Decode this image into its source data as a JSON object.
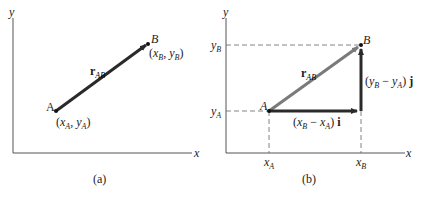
{
  "panels": [
    {
      "caption": "(a)",
      "axis_x_label": "x",
      "axis_y_label": "y",
      "vector_label": "r",
      "vector_label_sub": "AB",
      "point_a_label": "A",
      "point_b_label": "B",
      "point_a_coords": {
        "open": "(",
        "x": "x",
        "x_sub": "A",
        "sep": ", ",
        "y": "y",
        "y_sub": "A",
        "close": ")"
      },
      "point_b_coords": {
        "open": "(",
        "x": "x",
        "x_sub": "B",
        "sep": ", ",
        "y": "y",
        "y_sub": "B",
        "close": ")"
      }
    },
    {
      "caption": "(b)",
      "axis_x_label": "x",
      "axis_y_label": "y",
      "vector_label": "r",
      "vector_label_sub": "AB",
      "point_a_label": "A",
      "point_b_label": "B",
      "tick_xa": "x",
      "tick_xa_sub": "A",
      "tick_xb": "x",
      "tick_xb_sub": "B",
      "tick_ya": "y",
      "tick_ya_sub": "A",
      "tick_yb": "y",
      "tick_yb_sub": "B",
      "horizontal_component": {
        "open": "(",
        "a": "x",
        "a_sub": "B",
        "minus": " − ",
        "b": "x",
        "b_sub": "A",
        "close": ") ",
        "unit": "i"
      },
      "vertical_component": {
        "open": "(",
        "a": "y",
        "a_sub": "B",
        "minus": " − ",
        "b": "y",
        "b_sub": "A",
        "close": ") ",
        "unit": "j"
      }
    }
  ],
  "colors": {
    "axis": "#555555",
    "vector_dark": "#2a2a2a",
    "vector_gray": "#7a7a7a",
    "dashed": "#666666"
  }
}
